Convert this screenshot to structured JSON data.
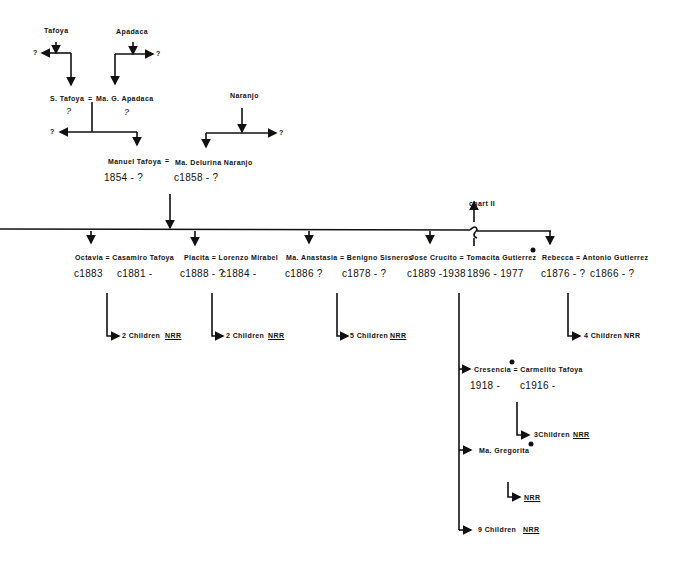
{
  "diagram_type": "family-tree",
  "colors": {
    "ink": "#111111",
    "background": "#ffffff"
  },
  "gen1": {
    "tafoya": "Tafoya",
    "apadaca": "Apadaca",
    "naranjo": "Naranjo",
    "unknown": "?"
  },
  "gen2": {
    "couple": {
      "husband": "S. Tafoya",
      "sep": "=",
      "wife": "Ma. G. Apadaca"
    },
    "husband_dates": "?",
    "wife_dates": "?"
  },
  "gen3": {
    "husband": "Manuel Tafoya",
    "sep": "=",
    "wife": "Ma. Delurina Naranjo",
    "husband_dates": "1854 - ?",
    "wife_dates": "c1858 - ?"
  },
  "chart_link": "chart II",
  "children": [
    {
      "label": "Octavia = Casamiro Tafoya",
      "dates1": "c1883",
      "dates2": "c1881 -",
      "descendants": "2 Children",
      "nrr": "NRR"
    },
    {
      "label": "Placita = Lorenzo  Mirabel",
      "dates1": "c1888 - ?",
      "dates2": "c1884 -",
      "descendants": "2 Children",
      "nrr": "NRR"
    },
    {
      "label": "Ma. Anastasia = Benigno Sisneros",
      "dates1": "c1886 ?",
      "dates2": "c1878 - ?",
      "descendants": "5 Children",
      "nrr": "NRR"
    },
    {
      "label": "Jose Crucito = Tomacita Gutierrez",
      "dates1": "c1889 -1938",
      "dates2": "1896 - 1977"
    },
    {
      "label": "Rebecca = Antonio  Gutierrez",
      "dates1": "c1876 - ?",
      "dates2": "c1866 - ?",
      "descendants": "4 Children",
      "nrr": "NRR"
    }
  ],
  "grandchildren": [
    {
      "label": "Cresencia = Carmelito Tafoya",
      "dates1": "1918 -",
      "dates2": "c1916 -",
      "descendants": "3Children",
      "nrr": "NRR"
    },
    {
      "label": "Ma. Gregorita",
      "nrr": "NRR"
    },
    {
      "label": "9 Children",
      "nrr": "NRR"
    }
  ]
}
